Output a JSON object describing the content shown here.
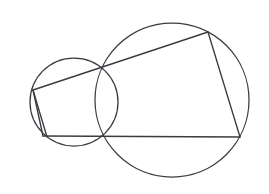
{
  "figure": {
    "background_color": "#ffffff",
    "stroke_color": "#3b3b42",
    "canvas": {
      "width": 269,
      "height": 194
    }
  },
  "chart_data": {
    "type": "diagram",
    "xlabel": "",
    "ylabel": "",
    "xlim": [
      0,
      269
    ],
    "ylim": [
      0,
      194
    ],
    "grid": false,
    "legend": "none",
    "circles": [
      {
        "name": "left-circle",
        "cx": 74,
        "cy": 102,
        "r": 44,
        "stroke": "#3b3b42",
        "fill": "none"
      },
      {
        "name": "right-circle",
        "cx": 172,
        "cy": 100,
        "r": 77,
        "stroke": "#3b3b42",
        "fill": "none"
      }
    ],
    "points": [
      {
        "name": "left-vertex",
        "x": 33,
        "y": 90
      },
      {
        "name": "upper-intersection",
        "x": 116,
        "y": 62
      },
      {
        "name": "top-right-vertex",
        "x": 208,
        "y": 32
      },
      {
        "name": "right-vertex",
        "x": 240,
        "y": 137
      },
      {
        "name": "lower-intersection",
        "x": 117,
        "y": 137
      },
      {
        "name": "bottom-left-vertex",
        "x": 43,
        "y": 136
      }
    ],
    "segments": [
      {
        "name": "upper-diagonal",
        "from": "left-vertex",
        "to": "top-right-vertex",
        "x1": 33,
        "y1": 90,
        "x2": 208,
        "y2": 32
      },
      {
        "name": "right-chord",
        "from": "top-right-vertex",
        "to": "right-vertex",
        "x1": 208,
        "y1": 32,
        "x2": 240,
        "y2": 137
      },
      {
        "name": "baseline",
        "from": "bottom-left-vertex",
        "to": "right-vertex",
        "x1": 43,
        "y1": 136,
        "x2": 240,
        "y2": 137
      },
      {
        "name": "left-chord",
        "from": "left-vertex",
        "to": "bottom-left-vertex",
        "x1": 33,
        "y1": 90,
        "x2": 43,
        "y2": 136
      },
      {
        "name": "left-inner-chord",
        "from": "left-vertex",
        "to": "lower-intersection",
        "x1": 33,
        "y1": 90,
        "x2": 47,
        "y2": 137
      }
    ],
    "labels": []
  }
}
